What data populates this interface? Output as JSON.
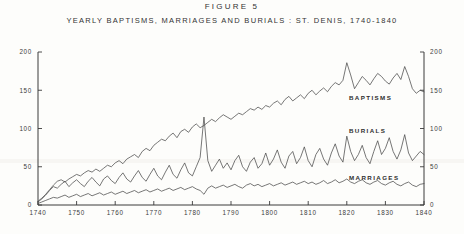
{
  "figure": {
    "number": "FIGURE 5",
    "subtitle": "YEARLY BAPTISMS, MARRIAGES AND BURIALS :  ST. DENIS, 1740-1840"
  },
  "axes": {
    "y_ticks_left": [
      "200",
      "150",
      "100",
      "50",
      "0"
    ],
    "y_ticks_right": [
      "200",
      "150",
      "100",
      "50",
      "0"
    ],
    "x_ticks": [
      "1740",
      "1750",
      "1760",
      "1770",
      "1780",
      "1790",
      "1800",
      "1810",
      "1820",
      "1830",
      "1840"
    ]
  },
  "series_labels": {
    "baptisms": "BAPTISMS",
    "burials": "BURIALS",
    "marriages": "MARRIAGES"
  },
  "chart_data": {
    "type": "line",
    "title": "FIGURE 5",
    "subtitle": "YEARLY BAPTISMS, MARRIAGES AND BURIALS :  ST. DENIS, 1740-1840",
    "xlabel": "",
    "ylabel": "",
    "xlim": [
      1740,
      1840
    ],
    "ylim": [
      0,
      200
    ],
    "ytick_values": [
      0,
      50,
      100,
      150,
      200
    ],
    "xtick_values": [
      1740,
      1750,
      1760,
      1770,
      1780,
      1790,
      1800,
      1810,
      1820,
      1830,
      1840
    ],
    "grid": false,
    "legend": "inline-annotations",
    "x": [
      1740,
      1741,
      1742,
      1743,
      1744,
      1745,
      1746,
      1747,
      1748,
      1749,
      1750,
      1751,
      1752,
      1753,
      1754,
      1755,
      1756,
      1757,
      1758,
      1759,
      1760,
      1761,
      1762,
      1763,
      1764,
      1765,
      1766,
      1767,
      1768,
      1769,
      1770,
      1771,
      1772,
      1773,
      1774,
      1775,
      1776,
      1777,
      1778,
      1779,
      1780,
      1781,
      1782,
      1783,
      1784,
      1785,
      1786,
      1787,
      1788,
      1789,
      1790,
      1791,
      1792,
      1793,
      1794,
      1795,
      1796,
      1797,
      1798,
      1799,
      1800,
      1801,
      1802,
      1803,
      1804,
      1805,
      1806,
      1807,
      1808,
      1809,
      1810,
      1811,
      1812,
      1813,
      1814,
      1815,
      1816,
      1817,
      1818,
      1819,
      1820,
      1821,
      1822,
      1823,
      1824,
      1825,
      1826,
      1827,
      1828,
      1829,
      1830,
      1831,
      1832,
      1833,
      1834,
      1835,
      1836,
      1837,
      1838,
      1839,
      1840
    ],
    "series": [
      {
        "name": "BAPTISMS",
        "values": [
          5,
          9,
          14,
          20,
          26,
          31,
          33,
          30,
          34,
          37,
          40,
          38,
          42,
          45,
          43,
          47,
          44,
          48,
          52,
          50,
          55,
          58,
          54,
          60,
          63,
          66,
          62,
          70,
          74,
          71,
          78,
          82,
          86,
          84,
          90,
          94,
          88,
          96,
          99,
          95,
          102,
          106,
          101,
          104,
          108,
          112,
          109,
          114,
          118,
          115,
          112,
          116,
          120,
          118,
          122,
          126,
          124,
          128,
          125,
          130,
          128,
          133,
          136,
          131,
          138,
          142,
          136,
          140,
          144,
          139,
          146,
          150,
          144,
          149,
          153,
          148,
          155,
          160,
          157,
          163,
          186,
          170,
          152,
          160,
          168,
          163,
          157,
          165,
          172,
          168,
          162,
          158,
          166,
          172,
          164,
          181,
          168,
          152,
          146,
          150,
          148
        ]
      },
      {
        "name": "BURIALS",
        "values": [
          4,
          8,
          13,
          19,
          24,
          22,
          27,
          31,
          24,
          29,
          33,
          28,
          24,
          31,
          36,
          30,
          25,
          34,
          38,
          32,
          28,
          36,
          42,
          34,
          30,
          38,
          45,
          36,
          31,
          40,
          48,
          38,
          33,
          43,
          52,
          40,
          35,
          46,
          55,
          42,
          38,
          50,
          62,
          115,
          58,
          44,
          52,
          60,
          48,
          55,
          46,
          58,
          65,
          50,
          44,
          56,
          62,
          48,
          54,
          68,
          52,
          60,
          72,
          56,
          48,
          64,
          70,
          54,
          62,
          76,
          58,
          50,
          66,
          74,
          60,
          52,
          68,
          80,
          64,
          56,
          90,
          70,
          58,
          66,
          78,
          62,
          54,
          70,
          84,
          66,
          74,
          88,
          70,
          60,
          72,
          92,
          68,
          58,
          64,
          70,
          66
        ]
      },
      {
        "name": "MARRIAGES",
        "values": [
          2,
          4,
          6,
          8,
          10,
          9,
          11,
          13,
          10,
          12,
          14,
          11,
          13,
          15,
          12,
          14,
          16,
          13,
          15,
          17,
          14,
          16,
          18,
          15,
          17,
          19,
          16,
          18,
          20,
          17,
          19,
          21,
          18,
          20,
          22,
          19,
          21,
          23,
          20,
          22,
          24,
          21,
          19,
          14,
          22,
          25,
          22,
          24,
          26,
          23,
          25,
          27,
          24,
          22,
          26,
          28,
          25,
          27,
          24,
          26,
          28,
          25,
          27,
          29,
          26,
          28,
          30,
          27,
          29,
          31,
          28,
          30,
          27,
          29,
          32,
          28,
          30,
          33,
          29,
          31,
          34,
          30,
          28,
          31,
          33,
          29,
          27,
          30,
          32,
          28,
          26,
          29,
          31,
          27,
          25,
          28,
          30,
          26,
          24,
          27,
          28
        ]
      }
    ]
  }
}
